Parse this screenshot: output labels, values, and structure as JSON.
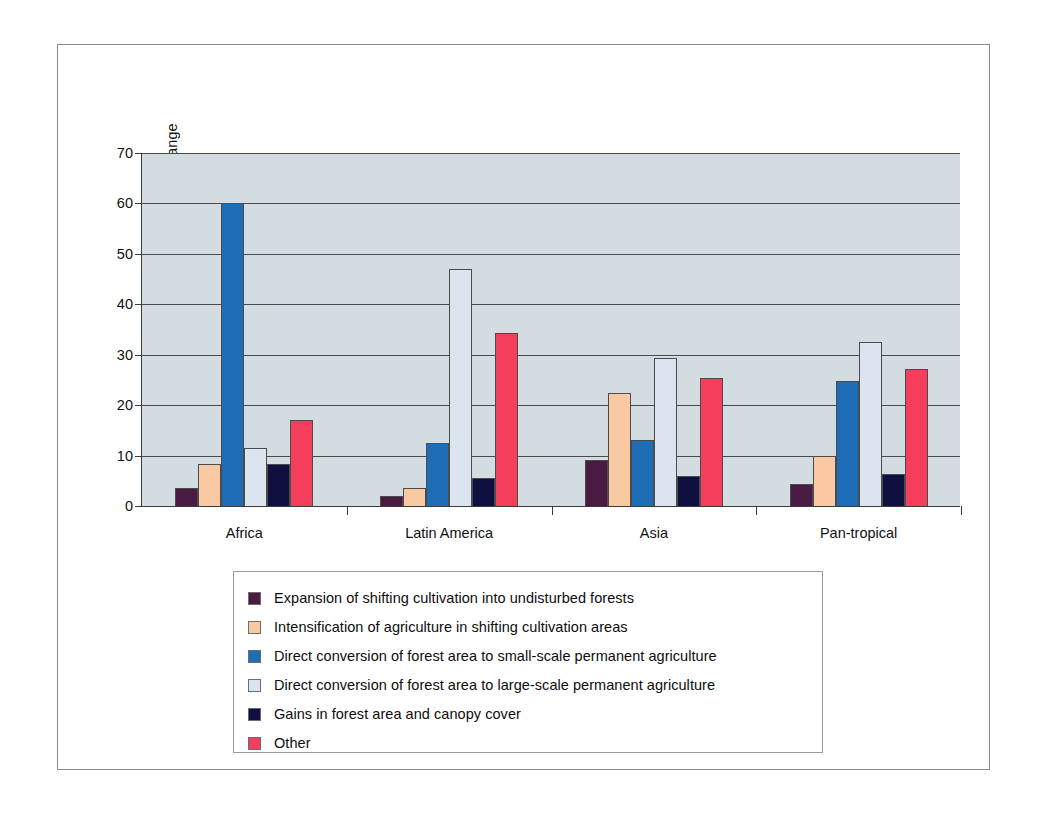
{
  "chart_data": {
    "type": "bar",
    "title": "",
    "xlabel": "",
    "ylabel": "Percentage of total area change",
    "ylim": [
      0,
      70
    ],
    "ytick_labels": [
      "0",
      "10",
      "20",
      "30",
      "40",
      "50",
      "60",
      "70"
    ],
    "ytick_values": [
      0,
      10,
      20,
      30,
      40,
      50,
      60,
      70
    ],
    "grid": true,
    "legend_position": "below-plot",
    "categories": [
      "Africa",
      "Latin America",
      "Asia",
      "Pan-tropical"
    ],
    "series": [
      {
        "name": "Expansion of shifting cultivation into undisturbed forests",
        "color": "#4a1b42",
        "values": [
          3.5,
          2.0,
          9.2,
          4.3
        ]
      },
      {
        "name": "Intensification of agriculture in shifting cultivation areas",
        "color": "#f9c9a4",
        "values": [
          8.3,
          3.5,
          22.5,
          9.9
        ]
      },
      {
        "name": "Direct conversion of forest area to small-scale permanent agriculture",
        "color": "#1d6cb5",
        "values": [
          60.0,
          12.5,
          13.0,
          24.8
        ]
      },
      {
        "name": "Direct conversion of forest area to large-scale permanent agriculture",
        "color": "#dce4f0",
        "values": [
          11.5,
          47.0,
          29.4,
          32.5
        ]
      },
      {
        "name": "Gains in forest area and canopy cover",
        "color": "#101040",
        "values": [
          8.3,
          5.6,
          6.0,
          6.3
        ]
      },
      {
        "name": "Other",
        "color": "#f53e5c",
        "values": [
          17.0,
          34.4,
          25.4,
          27.1
        ]
      }
    ]
  },
  "colors": {
    "plot_background": "#d3dde1",
    "gridline": "#4a4a4a",
    "axis": "#3a3a3a",
    "frame_border": "#8a8a8a",
    "legend_border": "#9a9a9a",
    "page_background": "#ffffff"
  }
}
